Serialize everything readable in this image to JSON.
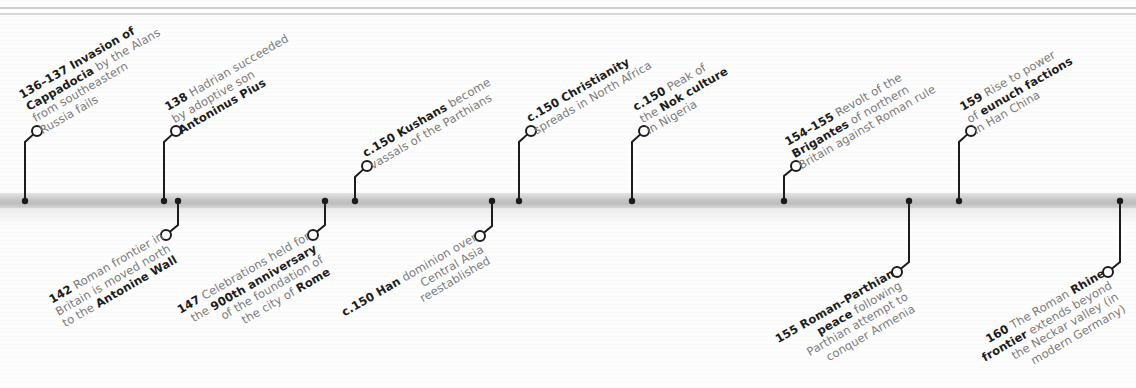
{
  "timeline": {
    "colors": {
      "line": "#1c1c1c",
      "bar": "#c6c6c6",
      "text_bold": "#1c1c1c",
      "text_normal": "#7a7a7a",
      "background": "#fdfdfd"
    },
    "events_above": [
      {
        "id": "e136",
        "dot_x": 25,
        "elbow_y": 142,
        "circle": [
          37,
          131
        ],
        "lines": [
          [
            {
              "t": "136–137 ",
              "b": true
            },
            {
              "t": "Invasion of",
              "b": true
            }
          ],
          [
            {
              "t": "Cappadocia",
              "b": true
            },
            {
              "t": " by the Alans",
              "b": false
            }
          ],
          [
            {
              "t": "from southeastern",
              "b": false
            }
          ],
          [
            {
              "t": "Russia fails",
              "b": false
            }
          ]
        ]
      },
      {
        "id": "e138",
        "dot_x": 164,
        "elbow_y": 142,
        "circle": [
          176,
          131
        ],
        "lines": [
          [
            {
              "t": "138",
              "b": true
            },
            {
              "t": " Hadrian succeeded",
              "b": false
            }
          ],
          [
            {
              "t": "by adoptive son",
              "b": false
            }
          ],
          [
            {
              "t": "Antoninus Pius",
              "b": true
            }
          ]
        ]
      },
      {
        "id": "e150k",
        "dot_x": 355,
        "elbow_y": 177,
        "circle": [
          367,
          166
        ],
        "lines": [
          [
            {
              "t": "c.150 Kushans",
              "b": true
            },
            {
              "t": " become",
              "b": false
            }
          ],
          [
            {
              "t": "vassals of the Parthians",
              "b": false
            }
          ]
        ]
      },
      {
        "id": "e150c",
        "dot_x": 519,
        "elbow_y": 142,
        "circle": [
          531,
          131
        ],
        "lines": [
          [
            {
              "t": "c.150 Christianity",
              "b": true
            }
          ],
          [
            {
              "t": "spreads in North Africa",
              "b": false
            }
          ]
        ]
      },
      {
        "id": "e150n",
        "dot_x": 632,
        "elbow_y": 142,
        "circle": [
          644,
          131
        ],
        "lines": [
          [
            {
              "t": "c.150",
              "b": true
            },
            {
              "t": " Peak of",
              "b": false
            }
          ],
          [
            {
              "t": "the ",
              "b": false
            },
            {
              "t": "Nok culture",
              "b": true
            }
          ],
          [
            {
              "t": "in Nigeria",
              "b": false
            }
          ]
        ]
      },
      {
        "id": "e154",
        "dot_x": 784,
        "elbow_y": 176,
        "circle": [
          796,
          166
        ],
        "lines": [
          [
            {
              "t": "154–155",
              "b": true
            },
            {
              "t": " Revolt of the",
              "b": false
            }
          ],
          [
            {
              "t": "Brigantes",
              "b": true
            },
            {
              "t": " of northern",
              "b": false
            }
          ],
          [
            {
              "t": "Britain against Roman rule",
              "b": false
            }
          ]
        ]
      },
      {
        "id": "e159",
        "dot_x": 959,
        "elbow_y": 142,
        "circle": [
          971,
          131
        ],
        "lines": [
          [
            {
              "t": "159",
              "b": true
            },
            {
              "t": " Rise to power",
              "b": false
            }
          ],
          [
            {
              "t": "of ",
              "b": false
            },
            {
              "t": "eunuch factions",
              "b": true
            }
          ],
          [
            {
              "t": "in Han China",
              "b": false
            }
          ]
        ]
      }
    ],
    "events_below": [
      {
        "id": "e142",
        "dot_x": 178,
        "elbow_y": 225,
        "circle": [
          166,
          235
        ],
        "lines": [
          [
            {
              "t": "142",
              "b": true
            },
            {
              "t": " Roman frontier in",
              "b": false
            }
          ],
          [
            {
              "t": "Britain is moved north",
              "b": false
            }
          ],
          [
            {
              "t": "to the ",
              "b": false
            },
            {
              "t": "Antonine Wall",
              "b": true
            }
          ]
        ]
      },
      {
        "id": "e147",
        "dot_x": 325,
        "elbow_y": 225,
        "circle": [
          313,
          235
        ],
        "lines": [
          [
            {
              "t": "147",
              "b": true
            },
            {
              "t": " Celebrations held for",
              "b": false
            }
          ],
          [
            {
              "t": "the ",
              "b": false
            },
            {
              "t": "900th anniversary",
              "b": true
            }
          ],
          [
            {
              "t": "of the foundation of",
              "b": false
            }
          ],
          [
            {
              "t": "the city of ",
              "b": false
            },
            {
              "t": "Rome",
              "b": true
            }
          ]
        ]
      },
      {
        "id": "e150h",
        "dot_x": 492,
        "elbow_y": 226,
        "circle": [
          480,
          236
        ],
        "lines": [
          [
            {
              "t": "c.150 Han",
              "b": true
            },
            {
              "t": " dominion over",
              "b": false
            }
          ],
          [
            {
              "t": "Central Asia",
              "b": false
            }
          ],
          [
            {
              "t": "reestablished",
              "b": false
            }
          ]
        ]
      },
      {
        "id": "e155",
        "dot_x": 909,
        "elbow_y": 262,
        "circle": [
          897,
          272
        ],
        "lines": [
          [
            {
              "t": "155 Roman–Parthian",
              "b": true
            }
          ],
          [
            {
              "t": "peace",
              "b": true
            },
            {
              "t": " following",
              "b": false
            }
          ],
          [
            {
              "t": "Parthian attempt to",
              "b": false
            }
          ],
          [
            {
              "t": "conquer Armenia",
              "b": false
            }
          ]
        ]
      },
      {
        "id": "e160",
        "dot_x": 1120,
        "elbow_y": 262,
        "circle": [
          1108,
          272
        ],
        "lines": [
          [
            {
              "t": "160",
              "b": true
            },
            {
              "t": " The Roman ",
              "b": false
            },
            {
              "t": "Rhine",
              "b": true
            }
          ],
          [
            {
              "t": "frontier",
              "b": true
            },
            {
              "t": " extends beyond",
              "b": false
            }
          ],
          [
            {
              "t": "the Neckar valley (in",
              "b": false
            }
          ],
          [
            {
              "t": "modern Germany)",
              "b": false
            }
          ]
        ]
      }
    ]
  }
}
